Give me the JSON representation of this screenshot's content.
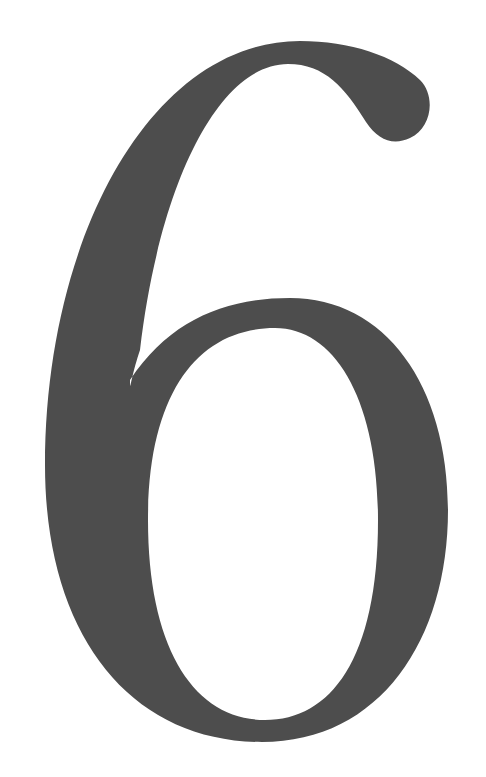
{
  "numeral": {
    "text": "6",
    "color": "#4d4d4d",
    "background": "#ffffff"
  }
}
